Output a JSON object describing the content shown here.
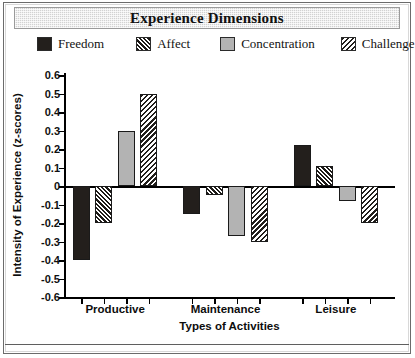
{
  "title": "Experience Dimensions",
  "legend": {
    "items": [
      {
        "label": "Freedom",
        "pattern": "solid-black",
        "color": "#231f1c"
      },
      {
        "label": "Affect",
        "pattern": "crosshatch",
        "color": "#1d1a17"
      },
      {
        "label": "Concentration",
        "pattern": "solid-gray",
        "color": "#b3b3b3"
      },
      {
        "label": "Challenge",
        "pattern": "diagonal",
        "color": "#211e1b"
      }
    ]
  },
  "axes": {
    "ylabel": "Intensity of Experience (z-scores)",
    "xlabel": "Types of Activities",
    "ytick_labels": [
      "0.6",
      "0.5",
      "0.4",
      "0.3",
      "0.2",
      "0.1",
      "0",
      "-0.1",
      "-0.2",
      "-0.3",
      "-0.4",
      "-0.5",
      "-0.6"
    ]
  },
  "chart_data": {
    "type": "bar",
    "title": "Experience Dimensions",
    "xlabel": "Types of Activities",
    "ylabel": "Intensity of Experience (z-scores)",
    "categories": [
      "Productive",
      "Maintenance",
      "Leisure"
    ],
    "series": [
      {
        "name": "Freedom",
        "values": [
          -0.4,
          -0.15,
          0.22
        ]
      },
      {
        "name": "Affect",
        "values": [
          -0.2,
          -0.05,
          0.11
        ]
      },
      {
        "name": "Concentration",
        "values": [
          0.3,
          -0.27,
          -0.08
        ]
      },
      {
        "name": "Challenge",
        "values": [
          0.5,
          -0.3,
          -0.2
        ]
      }
    ],
    "ylim": [
      -0.6,
      0.6
    ],
    "ytick_step": 0.1,
    "grid": false,
    "legend_position": "top",
    "zero_line": true
  }
}
